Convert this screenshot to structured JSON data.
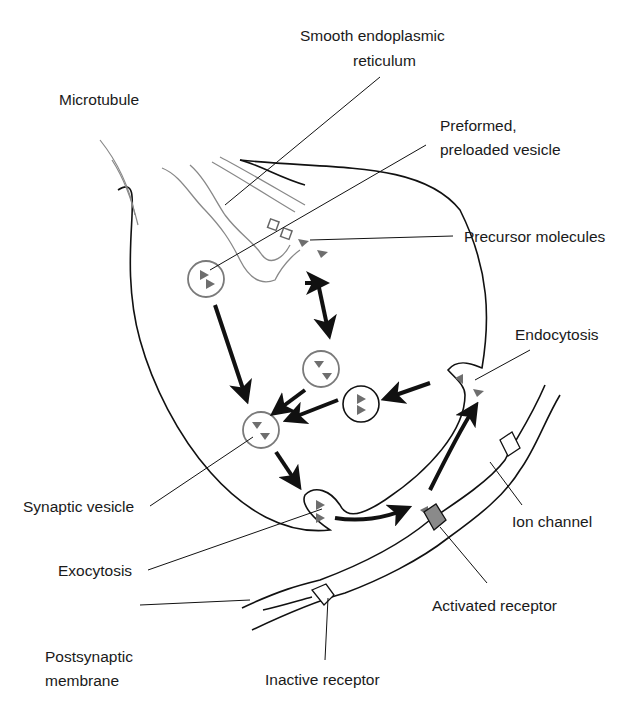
{
  "diagram": {
    "type": "synaptic-neurotransmission",
    "labels": {
      "smooth_er_line1": "Smooth endoplasmic",
      "smooth_er_line2": "reticulum",
      "microtubule": "Microtubule",
      "preformed_line1": "Preformed,",
      "preformed_line2": "preloaded vesicle",
      "precursor": "Precursor molecules",
      "endocytosis": "Endocytosis",
      "synaptic_vesicle": "Synaptic vesicle",
      "ion_channel": "Ion channel",
      "exocytosis": "Exocytosis",
      "activated_receptor": "Activated receptor",
      "postsynaptic_line1": "Postsynaptic",
      "postsynaptic_line2": "membrane",
      "inactive_receptor": "Inactive receptor"
    },
    "colors": {
      "line": "#111111",
      "vesicle_gray": "#7a7a7a",
      "triangle": "#6e6e6e",
      "activated_fill": "#8a8a8a"
    }
  }
}
